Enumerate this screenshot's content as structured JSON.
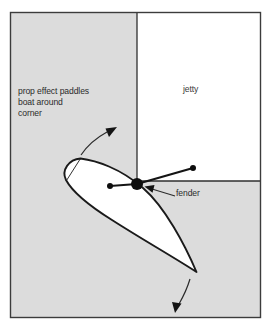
{
  "figure": {
    "kind": "boat-handling-diagram",
    "colors": {
      "water_fill": "#dcdcdc",
      "jetty_fill": "#ffffff",
      "hull_fill": "#ffffff",
      "outline": "#1a1a1a",
      "frame": "#3c3c3c",
      "text": "#2b2b2b",
      "fender_dot": "#0d0d0d"
    },
    "frame": {
      "x": 10,
      "y": 12,
      "width": 251,
      "height": 306
    },
    "water": {
      "name": "water-area"
    },
    "jetty": {
      "label": "jetty",
      "corner_x": 137,
      "corner_y": 181
    },
    "annotations": {
      "prop_effect": "prop effect paddles\nboat around\ncorner",
      "fender": "fender"
    },
    "markers": {
      "boat_pivot": {
        "x": 110,
        "y": 186,
        "r": 3.0
      },
      "fender": {
        "x": 137,
        "y": 184,
        "r": 6.0
      },
      "mooring_point": {
        "x": 193,
        "y": 168,
        "r": 3.0
      }
    },
    "arrows": {
      "bow_swing": "curved arrow up-right from bow",
      "stern_swing": "curved arrow down from stern",
      "fender_leader": "leader line with arrowhead pointing at fender"
    }
  }
}
